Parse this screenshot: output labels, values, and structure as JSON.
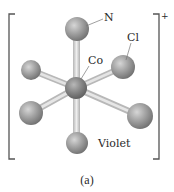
{
  "figure": {
    "caption": "(a)",
    "charge": "+",
    "labels": {
      "nitrogen": "N",
      "chlorine": "Cl",
      "cobalt": "Co",
      "isomer_name": "Violet"
    },
    "colors": {
      "background": "#ffffff",
      "bracket": "#555555",
      "bond": "#d4d4d4",
      "atom": "#9a9a9a",
      "central_atom": "#808080",
      "leader_line": "#777777"
    },
    "atoms": [
      {
        "name": "N-top",
        "element": "N"
      },
      {
        "name": "Cl-right-back",
        "element": "Cl"
      },
      {
        "name": "ligand-left-back",
        "element": "N"
      },
      {
        "name": "Co-center",
        "element": "Co"
      },
      {
        "name": "ligand-left-front",
        "element": "N"
      },
      {
        "name": "ligand-right-front",
        "element": "Cl"
      },
      {
        "name": "ligand-bottom",
        "element": "N"
      }
    ]
  }
}
